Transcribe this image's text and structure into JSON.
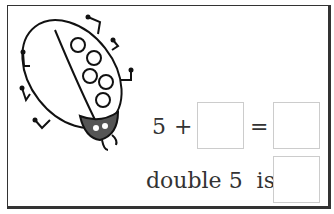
{
  "illustration": {
    "name": "ladybird",
    "spots": 6
  },
  "equation": {
    "addend": "5",
    "plus": "+",
    "equals": "="
  },
  "double": {
    "label": "double 5  is"
  }
}
